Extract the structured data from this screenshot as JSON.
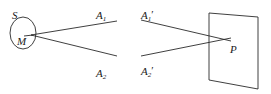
{
  "figure": {
    "caption": "",
    "background_color": "#ffffff",
    "stroke_color": "#2a2a2a",
    "label_color": "#1a1a1a",
    "width": 271,
    "height": 94
  },
  "left_diagram": {
    "source_label": "S",
    "point_label": "M",
    "ray_labels": {
      "upper_base": "A",
      "upper_sub": "1",
      "lower_base": "A",
      "lower_sub": "2"
    },
    "ellipse": {
      "center_x": 23,
      "center_y": 33,
      "radius_x": 13,
      "radius_y": 16
    },
    "vertex": {
      "x": 31,
      "y": 35
    },
    "upper_ray_end": {
      "x": 117,
      "y": 21
    },
    "lower_ray_end": {
      "x": 117,
      "y": 55
    }
  },
  "right_diagram": {
    "intersection_label": "P",
    "ray_labels": {
      "upper_base": "A",
      "upper_sub": "1",
      "upper_prime": "′",
      "lower_base": "A",
      "lower_sub": "2",
      "lower_prime": "′"
    },
    "upper_ray_start": {
      "x": 141,
      "y": 20
    },
    "lower_ray_start": {
      "x": 141,
      "y": 56
    },
    "intersection_point": {
      "x": 226,
      "y": 40
    },
    "plane": {
      "top_left": {
        "x": 209,
        "y": 13
      },
      "top_right": {
        "x": 258,
        "y": 17
      },
      "bottom_right": {
        "x": 258,
        "y": 89
      },
      "bottom_left": {
        "x": 209,
        "y": 80
      }
    }
  }
}
